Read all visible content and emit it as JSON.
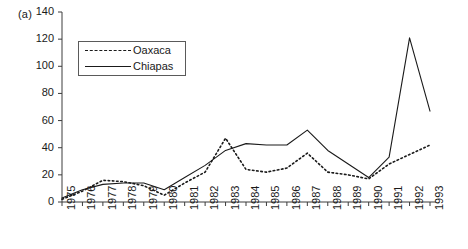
{
  "panel": {
    "label": "(a)"
  },
  "legend": {
    "position": "inside-top-left",
    "entries": [
      {
        "label": "Oaxaca",
        "style": "dashed"
      },
      {
        "label": "Chiapas",
        "style": "solid"
      }
    ]
  },
  "axes": {
    "y_ticks": [
      0,
      20,
      40,
      60,
      80,
      100,
      120,
      140
    ],
    "x_ticks": [
      "1975",
      "1976",
      "1977",
      "1978",
      "1979",
      "1980",
      "1981",
      "1982",
      "1983",
      "1984",
      "1985",
      "1986",
      "1987",
      "1988",
      "1989",
      "1990",
      "1991",
      "1992",
      "1993"
    ]
  },
  "colors": {
    "axis": "#3c3c3c",
    "series": "#1a1a1a",
    "background": "#ffffff"
  },
  "chart_data": {
    "type": "line",
    "title": "(a)",
    "xlabel": "",
    "ylabel": "",
    "xlim": [
      1975,
      1993
    ],
    "ylim": [
      0,
      140
    ],
    "ytick_step": 20,
    "grid": false,
    "legend_position": "inside-top-left",
    "x": [
      1975,
      1976,
      1977,
      1978,
      1979,
      1980,
      1981,
      1982,
      1983,
      1984,
      1985,
      1986,
      1987,
      1988,
      1989,
      1990,
      1991,
      1992,
      1993
    ],
    "series": [
      {
        "name": "Oaxaca",
        "style": "dashed",
        "values": [
          2,
          8,
          16,
          15,
          12,
          5,
          14,
          22,
          47,
          24,
          22,
          25,
          36,
          22,
          20,
          17,
          28,
          35,
          42
        ]
      },
      {
        "name": "Chiapas",
        "style": "solid",
        "values": [
          3,
          9,
          13,
          14,
          14,
          9,
          18,
          27,
          38,
          43,
          42,
          42,
          53,
          38,
          28,
          18,
          33,
          121,
          67
        ]
      }
    ]
  }
}
